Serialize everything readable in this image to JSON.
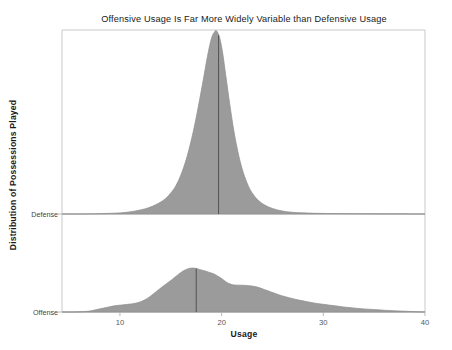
{
  "chart_data": {
    "type": "area",
    "title": "Offensive Usage Is Far More Widely Variable than Defensive Usage",
    "xlabel": "Usage",
    "ylabel": "Distribution of Possessions Played",
    "xlim": [
      4.3,
      40.0
    ],
    "xticks": [
      10,
      20,
      30,
      40
    ],
    "xticklabels": [
      "10",
      "20",
      "30",
      "40"
    ],
    "grid": false,
    "legend": false,
    "categories": [
      "Defense",
      "Offense"
    ],
    "series": [
      {
        "name": "Defense",
        "median": 19.7,
        "peak_x": 19.5,
        "peak_density": 1.0,
        "x": [
          4.3,
          6.0,
          8.0,
          10.0,
          11.0,
          12.0,
          12.8,
          13.5,
          14.0,
          14.5,
          15.0,
          15.5,
          16.0,
          16.5,
          17.0,
          17.4,
          17.8,
          18.2,
          18.6,
          19.0,
          19.3,
          19.5,
          19.8,
          20.1,
          20.4,
          20.8,
          21.2,
          21.6,
          22.0,
          22.5,
          23.0,
          23.6,
          24.2,
          25.0,
          26.0,
          27.0,
          28.5,
          30.0,
          32.0,
          35.0,
          40.0
        ],
        "y": [
          0.0,
          0.0,
          0.002,
          0.006,
          0.012,
          0.022,
          0.034,
          0.05,
          0.065,
          0.085,
          0.115,
          0.155,
          0.215,
          0.295,
          0.4,
          0.5,
          0.615,
          0.735,
          0.86,
          0.96,
          0.995,
          1.0,
          0.965,
          0.88,
          0.76,
          0.6,
          0.455,
          0.34,
          0.25,
          0.17,
          0.115,
          0.075,
          0.05,
          0.03,
          0.016,
          0.009,
          0.005,
          0.003,
          0.002,
          0.001,
          0.0
        ]
      },
      {
        "name": "Offense",
        "median": 17.5,
        "peak_x": 16.6,
        "peak_density": 1.0,
        "x": [
          4.3,
          5.5,
          6.5,
          7.2,
          7.8,
          8.4,
          9.0,
          9.6,
          10.2,
          10.8,
          11.2,
          11.8,
          12.4,
          13.0,
          13.6,
          14.2,
          14.8,
          15.4,
          16.0,
          16.4,
          16.8,
          17.2,
          17.6,
          18.0,
          18.4,
          18.8,
          19.2,
          19.6,
          20.0,
          20.4,
          20.8,
          21.2,
          21.8,
          22.4,
          23.0,
          23.6,
          24.2,
          24.8,
          25.4,
          26.0,
          26.8,
          27.6,
          28.4,
          29.2,
          30.0,
          31.0,
          32.0,
          33.0,
          34.0,
          35.0,
          36.0,
          37.0,
          38.0,
          39.0,
          40.0
        ],
        "y": [
          0.0,
          0.0,
          0.01,
          0.03,
          0.06,
          0.09,
          0.12,
          0.145,
          0.16,
          0.175,
          0.185,
          0.215,
          0.27,
          0.36,
          0.47,
          0.58,
          0.68,
          0.79,
          0.9,
          0.955,
          0.99,
          1.0,
          0.985,
          0.955,
          0.93,
          0.9,
          0.87,
          0.82,
          0.76,
          0.69,
          0.64,
          0.615,
          0.61,
          0.605,
          0.59,
          0.56,
          0.51,
          0.46,
          0.41,
          0.365,
          0.315,
          0.27,
          0.235,
          0.2,
          0.175,
          0.145,
          0.115,
          0.09,
          0.07,
          0.055,
          0.04,
          0.028,
          0.018,
          0.008,
          0.0
        ]
      }
    ],
    "colors": {
      "fill": "#9b9b9b",
      "stroke": "#8e8e8e",
      "median": "#4a4a4a",
      "frame": "#c9c9c9",
      "background": "#ffffff"
    }
  },
  "geometry": {
    "plot_left": 62,
    "plot_right": 425,
    "plot_top": 30,
    "plot_bottom": 312,
    "baseline_defense": 214,
    "baseline_offense": 312,
    "height_defense": 183,
    "height_offense": 44
  }
}
